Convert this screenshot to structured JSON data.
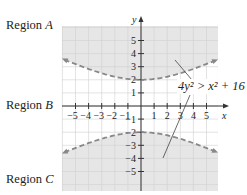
{
  "chart_data": {
    "type": "region",
    "title": "",
    "inequality": "4y^2 > x^2 + 16",
    "boundary": "hyperbola 4y^2 = x^2 + 16 (dashed)",
    "xlabel": "x",
    "ylabel": "y",
    "xlim": [
      -6,
      6
    ],
    "ylim": [
      -6.5,
      6.2
    ],
    "x_ticks": [
      -5,
      -4,
      -3,
      -2,
      -1,
      1,
      2,
      3,
      4,
      5
    ],
    "y_ticks": [
      -5,
      -4,
      -3,
      -2,
      -1,
      1,
      2,
      3,
      4,
      5
    ],
    "grid": true,
    "regions": [
      {
        "name": "Region A",
        "description": "above upper branch",
        "shaded": true
      },
      {
        "name": "Region B",
        "description": "between branches",
        "shaded": false
      },
      {
        "name": "Region C",
        "description": "below lower branch",
        "shaded": true
      }
    ],
    "vertices": [
      [
        0,
        2
      ],
      [
        0,
        -2
      ]
    ],
    "shade_color": "#e6e6e6",
    "curve_color": "#888888"
  },
  "labels": {
    "region_a_prefix": "Region ",
    "region_a_letter": "A",
    "region_b_prefix": "Region ",
    "region_b_letter": "B",
    "region_c_prefix": "Region ",
    "region_c_letter": "C",
    "equation": "4y² > x² + 16",
    "x_axis": "x",
    "y_axis": "y"
  }
}
